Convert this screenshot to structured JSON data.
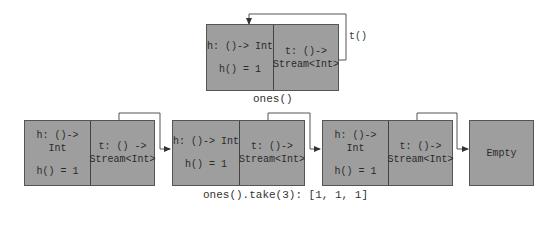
{
  "top_node": {
    "head_label": "h: ()-> Int",
    "head_value": "h() = 1",
    "tail_label": "t: ()->",
    "tail_type": "Stream<Int>",
    "loop_label": "t()",
    "caption": "ones()"
  },
  "chain": [
    {
      "head_label": "h: ()-> Int",
      "head_value": "h() = 1",
      "tail_label": "t: () ->",
      "tail_type": "Stream<Int>"
    },
    {
      "head_label": "h: ()-> Int",
      "head_value": "h() = 1",
      "tail_label": "t: ()->",
      "tail_type": "Stream<Int>"
    },
    {
      "head_label": "h: ()-> Int",
      "head_value": "h() = 1",
      "tail_label": "t: ()->",
      "tail_type": "Stream<Int>"
    }
  ],
  "empty_node": {
    "label": "Empty"
  },
  "chain_caption": "ones().take(3): [1, 1, 1]",
  "colors": {
    "node_fill": "#9e9e9e",
    "border": "#555555",
    "line": "#444444"
  }
}
